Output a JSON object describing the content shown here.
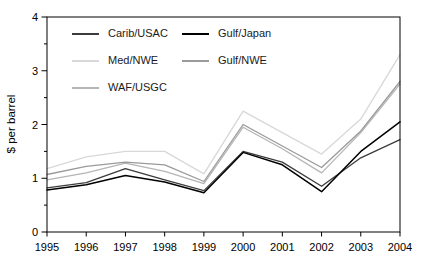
{
  "figure": {
    "kind": "line chart of spot tanker freight rates",
    "background_color": "#ffffff",
    "axis_color": "#000000"
  },
  "chart_data": {
    "type": "line",
    "title": "",
    "xlabel": "",
    "ylabel": "$ per barrel",
    "x": [
      1995,
      1996,
      1997,
      1998,
      1999,
      2000,
      2001,
      2002,
      2003,
      2004
    ],
    "xtick_labels": [
      "1995",
      "1996",
      "1997",
      "1998",
      "1999",
      "2000",
      "2001",
      "2002",
      "2003",
      "2004"
    ],
    "ylim": [
      0,
      4
    ],
    "yticks": [
      0,
      1,
      2,
      3,
      4
    ],
    "y_minor_tick_step": 0.5,
    "grid": false,
    "legend_position": "inside-top-left, two columns",
    "series": [
      {
        "name": "Carib/USAC",
        "color": "#3c3c3c",
        "values": [
          0.82,
          0.92,
          1.18,
          0.97,
          0.77,
          1.5,
          1.3,
          0.85,
          1.38,
          1.72
        ]
      },
      {
        "name": "Gulf/Japan",
        "color": "#000000",
        "values": [
          0.78,
          0.88,
          1.05,
          0.93,
          0.73,
          1.48,
          1.25,
          0.75,
          1.5,
          2.05
        ]
      },
      {
        "name": "Med/NWE",
        "color": "#d8d8d8",
        "values": [
          1.18,
          1.4,
          1.5,
          1.5,
          1.08,
          2.25,
          1.85,
          1.45,
          2.1,
          3.3
        ]
      },
      {
        "name": "Gulf/NWE",
        "color": "#9a9a9a",
        "values": [
          1.07,
          1.22,
          1.3,
          1.25,
          0.94,
          2.0,
          1.6,
          1.2,
          1.88,
          2.8
        ]
      },
      {
        "name": "WAF/USGC",
        "color": "#b5b5b5",
        "values": [
          0.97,
          1.1,
          1.28,
          1.13,
          0.9,
          1.95,
          1.55,
          1.1,
          1.85,
          2.75
        ]
      }
    ],
    "legend_columns": [
      {
        "entries": [
          "Carib/USAC",
          "Med/NWE",
          "WAF/USGC"
        ],
        "series_indexes": [
          0,
          2,
          4
        ]
      },
      {
        "entries": [
          "Gulf/Japan",
          "Gulf/NWE"
        ],
        "series_indexes": [
          1,
          3
        ]
      }
    ]
  }
}
